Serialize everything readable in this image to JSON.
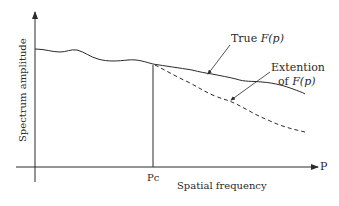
{
  "diagram": {
    "y_axis_label": "Spectrum amplitude",
    "x_axis_label": "Spatial frequency",
    "x_axis_end_label": "P",
    "cutoff_label": "Pc",
    "annotations": {
      "true_curve": {
        "prefix": "True ",
        "func": "F(p)"
      },
      "extension_curve": {
        "line1": "Extention",
        "line2_prefix": "of ",
        "func": "F(p)"
      }
    },
    "colors": {
      "ink": "#2a2a2a",
      "background": "#ffffff"
    }
  }
}
